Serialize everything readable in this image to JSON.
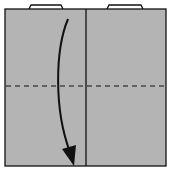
{
  "diagram": {
    "type": "origami-fold-step",
    "paper_color": "#b4b4b4",
    "line_color": "#111111",
    "background": "#ffffff",
    "elements": {
      "square": {
        "x": 5,
        "y": 9,
        "w": 161,
        "h": 157
      },
      "center_crease": {
        "x": 86
      },
      "fold_line": {
        "y": 86,
        "style": "dashed",
        "meaning": "valley fold"
      },
      "tabs": [
        {
          "x1": 29,
          "x2": 62
        },
        {
          "x1": 107,
          "x2": 142
        }
      ],
      "arrow": {
        "direction": "down",
        "meaning": "fold top edge down to bottom"
      }
    }
  }
}
